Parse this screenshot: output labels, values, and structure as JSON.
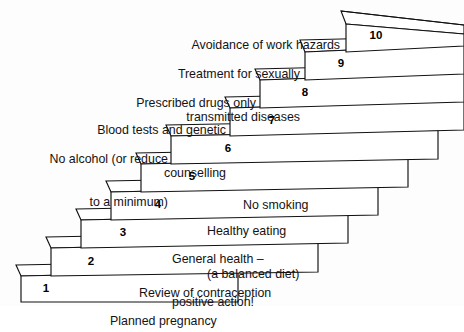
{
  "diagram": {
    "type": "staircase",
    "background_color": "#fdfdfd",
    "line_color": "#111111",
    "step_fill": "#ffffff",
    "steps": [
      {
        "number": "1",
        "label": "Planned pregnancy",
        "label_side": "right",
        "label_lines": [
          "Planned pregnancy"
        ]
      },
      {
        "number": "2",
        "label": "Review of contraception",
        "label_side": "right",
        "label_lines": [
          "Review of contraception"
        ]
      },
      {
        "number": "3",
        "label": "General health – positive action!",
        "label_side": "right",
        "label_lines": [
          "General health –",
          "positive action!"
        ]
      },
      {
        "number": "4",
        "label": "Healthy eating (a balanced diet)",
        "label_side": "right",
        "label_lines": [
          "Healthy eating",
          "(a balanced diet)"
        ]
      },
      {
        "number": "5",
        "label": "No smoking",
        "label_side": "right",
        "label_lines": [
          "No smoking"
        ]
      },
      {
        "number": "6",
        "label": "No alcohol (or reduce to a minimum)",
        "label_side": "left",
        "label_lines": [
          "No alcohol (or reduce",
          "to a minimum)"
        ]
      },
      {
        "number": "7",
        "label": "Blood tests and genetic counselling",
        "label_side": "left",
        "label_lines": [
          "Blood tests and genetic",
          "counselling"
        ]
      },
      {
        "number": "8",
        "label": "Prescribed drugs only",
        "label_side": "left",
        "label_lines": [
          "Prescribed drugs only"
        ]
      },
      {
        "number": "9",
        "label": "Treatment for sexually transmitted diseases",
        "label_side": "left",
        "label_lines": [
          "Treatment for sexually",
          "transmitted diseases"
        ]
      },
      {
        "number": "10",
        "label": "Avoidance of work hazards",
        "label_side": "left",
        "label_lines": [
          "Avoidance of work hazards"
        ]
      }
    ]
  }
}
